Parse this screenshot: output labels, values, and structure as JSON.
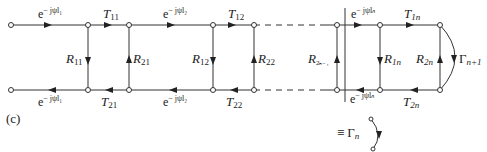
{
  "figure": {
    "caption": "(c)",
    "top_row": {
      "labels": [
        {
          "id": "prop1_top",
          "text": "e",
          "sup": "− jψl₁"
        },
        {
          "id": "T11",
          "text": "T",
          "sub": "11"
        },
        {
          "id": "prop2_top",
          "text": "e",
          "sup": "− jψl₂"
        },
        {
          "id": "T12",
          "text": "T",
          "sub": "12"
        },
        {
          "id": "propn_top",
          "text": "e",
          "sup": "− jψlₙ"
        },
        {
          "id": "T1n",
          "text": "T",
          "sub": "1n"
        }
      ]
    },
    "bottom_row": {
      "labels": [
        {
          "id": "prop1_bot",
          "text": "e",
          "sup": "− jψl₁"
        },
        {
          "id": "T21",
          "text": "T",
          "sub": "21"
        },
        {
          "id": "prop2_bot",
          "text": "e",
          "sup": "− jψl₂"
        },
        {
          "id": "T22",
          "text": "T",
          "sub": "22"
        },
        {
          "id": "propn_bot",
          "text": "e",
          "sup": "− jψlₙ"
        },
        {
          "id": "T2n",
          "text": "T",
          "sub": "2n"
        }
      ]
    },
    "verticals": [
      {
        "id": "R11",
        "text": "R",
        "sub": "11",
        "direction": "down"
      },
      {
        "id": "R21",
        "text": "R",
        "sub": "21",
        "direction": "up"
      },
      {
        "id": "R12",
        "text": "R",
        "sub": "12",
        "direction": "down"
      },
      {
        "id": "R22",
        "text": "R",
        "sub": "22",
        "direction": "up"
      },
      {
        "id": "R2n-1",
        "text": "R",
        "sub": "2ₙ₋₁",
        "direction": "up"
      },
      {
        "id": "R1n",
        "text": "R",
        "sub": "1n",
        "direction": "down"
      },
      {
        "id": "R2n",
        "text": "R",
        "sub": "2n",
        "direction": "up"
      }
    ],
    "load": {
      "text": "Γ",
      "sub": "n+1"
    },
    "equivalent": {
      "prefix": "≡",
      "text": "Γ",
      "sub": "n"
    }
  }
}
